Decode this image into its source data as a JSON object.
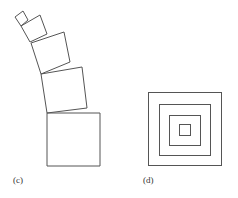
{
  "panels": [
    {
      "id": "c",
      "label": "(c)",
      "description": "stack of five squares, each smaller and increasingly rotated, curving up-left",
      "squares": [
        {
          "points": "47,113 100,113 100,166 47,166"
        },
        {
          "points": "41,74 82,67 87,108 47,113"
        },
        {
          "points": "31,43 64,32 70,62 41,74"
        },
        {
          "points": "21,26 40,15 47,34 30,42"
        },
        {
          "points": "15,17 23,11 28,20 21,26"
        }
      ]
    },
    {
      "id": "d",
      "label": "(d)",
      "description": "four concentric axis-aligned squares",
      "squares": [
        {
          "x": 148,
          "y": 92,
          "w": 73,
          "h": 73
        },
        {
          "x": 159,
          "y": 104,
          "w": 51,
          "h": 51
        },
        {
          "x": 169,
          "y": 115,
          "w": 31,
          "h": 30
        },
        {
          "x": 179,
          "y": 124,
          "w": 11,
          "h": 11
        }
      ]
    }
  ],
  "colors": {
    "stroke": "#555555",
    "background": "#ffffff"
  }
}
